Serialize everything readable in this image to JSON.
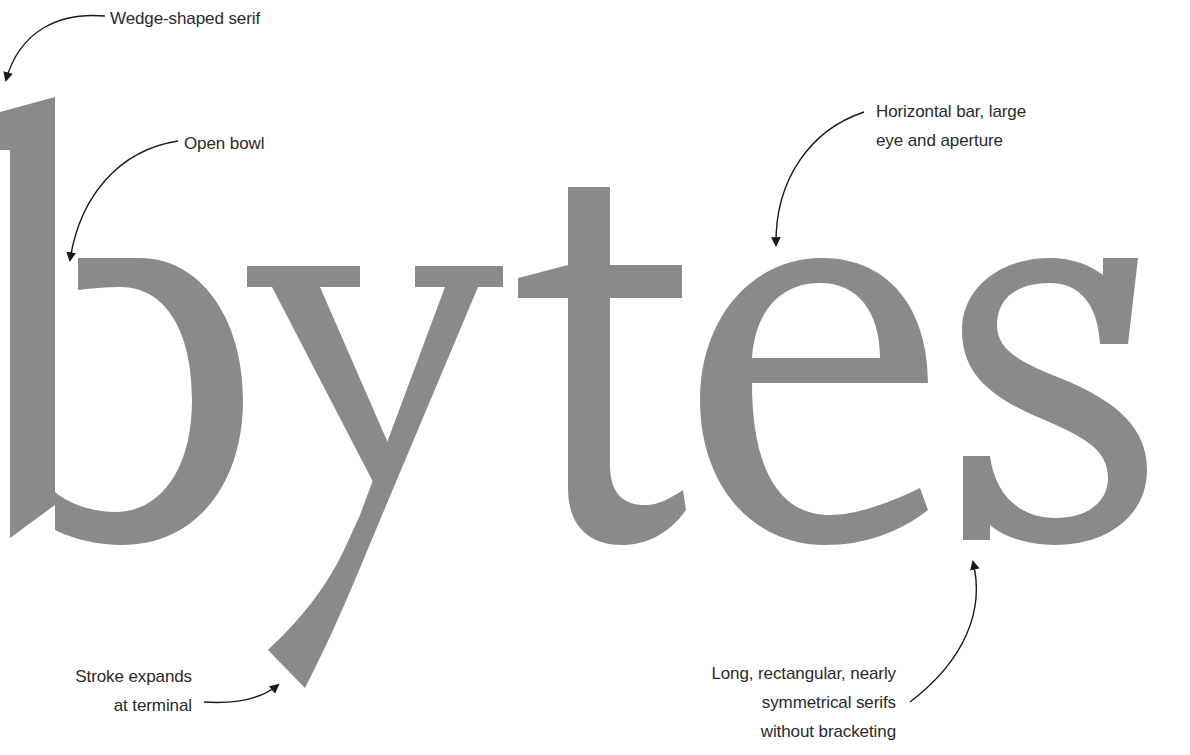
{
  "word": "bytes",
  "colors": {
    "glyph_fill": "#8a8a8a",
    "text": "#2a2a2a",
    "arrow": "#1a1a1a",
    "background": "#ffffff"
  },
  "annotations": [
    {
      "id": "wedge",
      "lines": [
        "Wedge-shaped serif"
      ],
      "target": "b-top-serif"
    },
    {
      "id": "bowl",
      "lines": [
        "Open bowl"
      ],
      "target": "b-bowl"
    },
    {
      "id": "bar",
      "lines": [
        "Horizontal bar, large",
        "eye and aperture"
      ],
      "target": "e-bar"
    },
    {
      "id": "stroke",
      "lines": [
        "Stroke expands",
        "at terminal"
      ],
      "target": "y-tail-terminal"
    },
    {
      "id": "serifs",
      "lines": [
        "Long, rectangular, nearly",
        "symmetrical serifs",
        "without bracketing"
      ],
      "target": "s-bottom-serif"
    }
  ]
}
